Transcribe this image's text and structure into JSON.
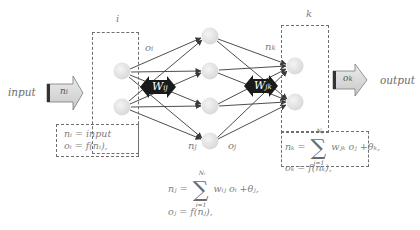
{
  "diagram": {
    "colors": {
      "node_fill": "#e4e4e4",
      "node_edge": "#cfcfcf",
      "connection": "#3a3a3a",
      "weight_arrow": "#1a1a1a",
      "io_arrow_fill": "#d6d6d6",
      "io_arrow_edge": "#7a7a7a",
      "dashed_box": "#6f6f6f",
      "text": "#7d7d7d"
    },
    "input_text": "input",
    "output_text": "output",
    "input_arrow_label": "n",
    "input_arrow_sub": "i",
    "output_arrow_label": "o",
    "output_arrow_sub": "k",
    "layers": {
      "i": {
        "label": "i",
        "nodes": 2
      },
      "j": {
        "label": "",
        "nodes": 4
      },
      "k": {
        "label": "k",
        "nodes": 2
      }
    },
    "weights": {
      "ij": {
        "main": "W",
        "sub": "ij"
      },
      "jk": {
        "main": "W",
        "sub": "jk"
      }
    },
    "edge_labels": {
      "oi": {
        "main": "o",
        "sub": "i"
      },
      "nj": {
        "main": "n",
        "sub": "j"
      },
      "oj": {
        "main": "o",
        "sub": "j"
      },
      "nk": {
        "main": "n",
        "sub": "k"
      }
    },
    "formulas": {
      "input_layer": {
        "line1": "nᵢ = input",
        "line2": "oᵢ = f(nᵢ),"
      },
      "hidden_layer": {
        "lhs": "nⱼ =",
        "sum_top": "Nᵢ",
        "sum_bottom": "i=1",
        "rhs": "wᵢⱼ oᵢ +θⱼ,",
        "line2": "oⱼ = f(nⱼ),"
      },
      "output_layer": {
        "lhs": "nₖ =",
        "sum_top": "Nⱼ",
        "sum_bottom": "j=1",
        "rhs": "wⱼₖ oⱼ +θₖ,",
        "line2": "oₖ = f(nₖ),"
      }
    }
  }
}
